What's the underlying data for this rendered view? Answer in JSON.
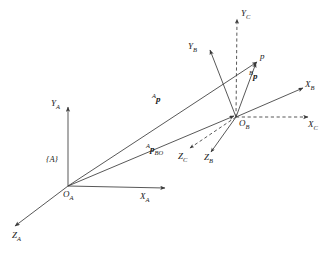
{
  "figure": {
    "type": "coordinate-frame-vector-diagram",
    "background": "#ffffff",
    "stroke_color": "#3a3a3a",
    "text_color": "#1a1a1a",
    "width": 329,
    "height": 253
  },
  "frames": {
    "A": {
      "origin_label": "O",
      "origin_sub": "A",
      "frame_label": "{A}",
      "axes": [
        {
          "name": "X",
          "sub": "A",
          "style": "solid"
        },
        {
          "name": "Y",
          "sub": "A",
          "style": "solid"
        },
        {
          "name": "Z",
          "sub": "A",
          "style": "solid"
        }
      ]
    },
    "B": {
      "origin_label": "O",
      "origin_sub": "B",
      "axes": [
        {
          "name": "X",
          "sub": "B",
          "style": "solid"
        },
        {
          "name": "Y",
          "sub": "B",
          "style": "solid"
        },
        {
          "name": "Z",
          "sub": "B",
          "style": "solid"
        }
      ]
    },
    "C": {
      "axes": [
        {
          "name": "X",
          "sub": "C",
          "style": "dashed"
        },
        {
          "name": "Y",
          "sub": "C",
          "style": "dashed"
        },
        {
          "name": "Z",
          "sub": "C",
          "style": "dashed"
        }
      ]
    }
  },
  "point": {
    "label": "p"
  },
  "vectors": [
    {
      "sup": "A",
      "symbol": "p",
      "sub": "",
      "from": "O_A",
      "to": "p"
    },
    {
      "sup": "A",
      "symbol": "p",
      "sub": "BO",
      "from": "O_A",
      "to": "O_B"
    },
    {
      "sup": "B",
      "symbol": "p",
      "sub": "",
      "from": "O_B",
      "to": "p"
    }
  ],
  "labels": {
    "x_a": "X",
    "x_a_sub": "A",
    "y_a": "Y",
    "y_a_sub": "A",
    "z_a": "Z",
    "z_a_sub": "A",
    "x_b": "X",
    "x_b_sub": "B",
    "y_b": "Y",
    "y_b_sub": "B",
    "z_b": "Z",
    "z_b_sub": "B",
    "x_c": "X",
    "x_c_sub": "C",
    "y_c": "Y",
    "y_c_sub": "C",
    "z_c": "Z",
    "z_c_sub": "C",
    "o_a": "O",
    "o_a_sub": "A",
    "o_b": "O",
    "o_b_sub": "B",
    "frame_a": "{A}",
    "point_p": "p",
    "vec_ap_sup": "A",
    "vec_ap_sym": "p",
    "vec_apbo_sup": "A",
    "vec_apbo_sym": "p",
    "vec_apbo_sub": "BO",
    "vec_bp_sup": "B",
    "vec_bp_sym": "p"
  }
}
